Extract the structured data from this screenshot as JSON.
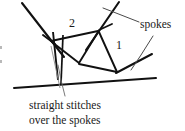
{
  "figure": {
    "title": "Straight stitches over the spokes",
    "type": "needlework-stitch-diagram",
    "background_color": "#ffffff",
    "ink_color": "#111111",
    "leader_color": "#555555",
    "faint_color": "#8a8a8a"
  },
  "labels": {
    "number_one": "1",
    "number_two": "2",
    "spokes": "spokes"
  },
  "caption": {
    "line1": "straight stitches",
    "line2": "over the spokes"
  },
  "diagram_data": {
    "type": "line-diagram",
    "description": "A web of crossing spokes with straight stitches worked over them; callout lines point to the spokes and to the stitches.",
    "nodes": [
      {
        "id": "n-left",
        "name": "left-spoke-junction",
        "x": 51,
        "y": 41
      },
      {
        "id": "n-top",
        "name": "upper-right-spoke-junction",
        "x": 98,
        "y": 31
      },
      {
        "id": "n-center",
        "name": "center-junction",
        "x": 79,
        "y": 63
      },
      {
        "id": "n-lowr",
        "name": "lower-right-junction",
        "x": 117,
        "y": 72
      }
    ],
    "spokes": [
      {
        "name": "spoke-upper-left-diagonal",
        "x1": 22,
        "y1": 3,
        "x2": 62,
        "y2": 55
      },
      {
        "name": "spoke-upper-right-diagonal",
        "x1": 118,
        "y1": 2,
        "x2": 88,
        "y2": 48
      },
      {
        "name": "spoke-lower-sweep",
        "x1": 14,
        "y1": 88,
        "x2": 155,
        "y2": 79
      },
      {
        "name": "spoke-right-tail",
        "x1": 117,
        "y1": 72,
        "x2": 150,
        "y2": 55
      },
      {
        "name": "spoke-left-tail",
        "x1": 51,
        "y1": 41,
        "x2": 44,
        "y2": 36
      }
    ],
    "stitch_bars": [
      {
        "name": "straight-stitch-bar-left",
        "x1": 53,
        "y1": 33,
        "x2": 58,
        "y2": 79
      },
      {
        "name": "straight-stitch-bar-right",
        "x1": 62,
        "y1": 36,
        "x2": 60,
        "y2": 83
      },
      {
        "name": "straight-stitch-bar-thin",
        "x1": 51,
        "y1": 45,
        "x2": 60,
        "y2": 86
      }
    ],
    "web_edges": [
      {
        "name": "web-edge-left-to-top",
        "x1": 51,
        "y1": 41,
        "x2": 98,
        "y2": 31
      },
      {
        "name": "web-edge-left-to-center",
        "x1": 51,
        "y1": 41,
        "x2": 79,
        "y2": 63
      },
      {
        "name": "web-edge-top-to-center",
        "x1": 98,
        "y1": 31,
        "x2": 79,
        "y2": 63
      },
      {
        "name": "web-edge-top-to-lowr",
        "x1": 98,
        "y1": 31,
        "x2": 117,
        "y2": 72
      },
      {
        "name": "web-edge-center-to-lowr",
        "x1": 79,
        "y1": 63,
        "x2": 117,
        "y2": 72
      }
    ],
    "leader_lines": [
      {
        "name": "leader-spokes-upper",
        "points": "138,22 112,13 104,9"
      },
      {
        "name": "leader-spokes-lower",
        "points": "152,37 140,56 131,69"
      },
      {
        "name": "leader-stitches",
        "points": "64,96 61,80 58,66"
      }
    ]
  }
}
